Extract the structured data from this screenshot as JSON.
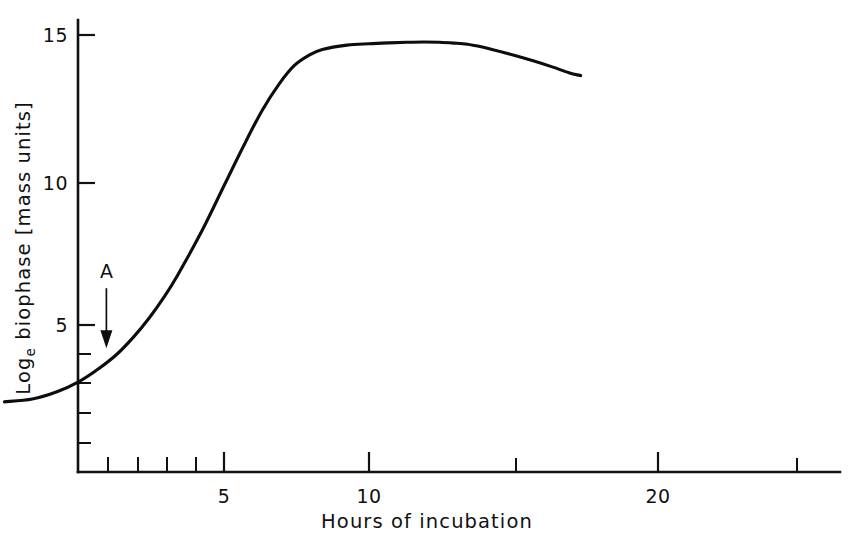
{
  "chart_data": {
    "type": "line",
    "title": "",
    "xlabel": "Hours of incubation",
    "ylabel": "Logₑ biophase [mass units]",
    "ylabel_main": "Log",
    "ylabel_subscript": "e",
    "ylabel_rest": " biophase [mass units]",
    "xscale": "log",
    "yscale": "linear",
    "xlim": [
      1.7,
      28
    ],
    "ylim": [
      0,
      15.5
    ],
    "grid": false,
    "legend": null,
    "x_major_ticks": [
      5,
      10,
      20
    ],
    "x_major_tick_labels": [
      "5",
      "10",
      "20"
    ],
    "x_minor_ticks": [
      2,
      3,
      4,
      15,
      25
    ],
    "y_major_ticks": [
      5,
      10,
      15
    ],
    "y_major_tick_labels": [
      "5",
      "10",
      "15"
    ],
    "y_minor_ticks": [
      1,
      2,
      3,
      4
    ],
    "annotations": [
      {
        "label": "A",
        "x": 2.85,
        "y": 4.2,
        "type": "down-arrow",
        "note": "arrow marking point A on rising limb"
      }
    ],
    "series": [
      {
        "name": "biophase growth curve",
        "x": [
          1.75,
          2.0,
          2.25,
          2.5,
          2.75,
          3.0,
          3.25,
          3.5,
          3.75,
          4.0,
          4.5,
          5.0,
          5.5,
          6.0,
          6.5,
          7.0,
          7.5,
          8.0,
          9.0,
          10.0,
          11.0,
          12.0,
          13.0,
          14.0,
          15.0,
          16.0,
          17.0,
          18.0,
          20.0,
          22.0,
          24.0,
          26.0,
          27.5
        ],
        "y": [
          2.35,
          2.45,
          2.7,
          3.05,
          3.5,
          4.0,
          4.6,
          5.25,
          5.95,
          6.7,
          8.25,
          9.8,
          11.2,
          12.4,
          13.3,
          13.95,
          14.3,
          14.5,
          14.65,
          14.7,
          14.73,
          14.75,
          14.76,
          14.75,
          14.72,
          14.68,
          14.6,
          14.5,
          14.3,
          14.1,
          13.9,
          13.7,
          13.6
        ]
      }
    ]
  },
  "axis_labels": {
    "x_title": "Hours of incubation",
    "y_title_main": "Log",
    "y_title_sub": "e",
    "y_title_rest": " biophase [mass units]"
  },
  "colors": {
    "curve": "#0d0d0d",
    "axis": "#111111",
    "background": "#ffffff"
  }
}
